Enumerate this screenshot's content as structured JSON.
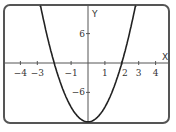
{
  "chart_data": {
    "type": "line",
    "title": "",
    "xlabel": "X",
    "ylabel": "Y",
    "equation": "y = 3x^2 - 12",
    "xlim": [
      -5,
      5
    ],
    "ylim": [
      -12,
      12
    ],
    "grid": false,
    "x_ticks": [
      -4,
      -3,
      -1,
      1,
      2,
      3,
      4
    ],
    "x_tick_labels": [
      "-4",
      "-3",
      "-1",
      "1",
      "2",
      "3",
      "4"
    ],
    "y_ticks": [
      6,
      -6
    ],
    "y_tick_labels": [
      "6",
      "-6"
    ],
    "series": [
      {
        "name": "parabola",
        "x": [
          -2.8,
          -2.5,
          -2,
          -1.5,
          -1,
          -0.5,
          0,
          0.5,
          1,
          1.5,
          2,
          2.5,
          2.8
        ],
        "y": [
          11.52,
          6.75,
          0,
          -5.25,
          -9,
          -11.25,
          -12,
          -11.25,
          -9,
          -5.25,
          0,
          6.75,
          11.52
        ]
      }
    ],
    "colors": {
      "curve": "#222222",
      "axes": "#555555",
      "frame": "#555555"
    }
  }
}
